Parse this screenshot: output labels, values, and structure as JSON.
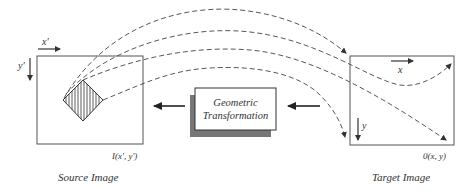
{
  "diagram": {
    "source": {
      "caption": "Source Image",
      "function_label": "I(x', y')",
      "x_axis_label": "x'",
      "y_axis_label": "y'"
    },
    "transform": {
      "line1": "Geometric",
      "line2": "Transformation"
    },
    "target": {
      "caption": "Target Image",
      "function_label": "0(x, y)",
      "x_axis_label": "x",
      "y_axis_label": "y"
    },
    "colors": {
      "stroke": "#333333",
      "shadow": "#777777",
      "background": "#ffffff"
    }
  }
}
